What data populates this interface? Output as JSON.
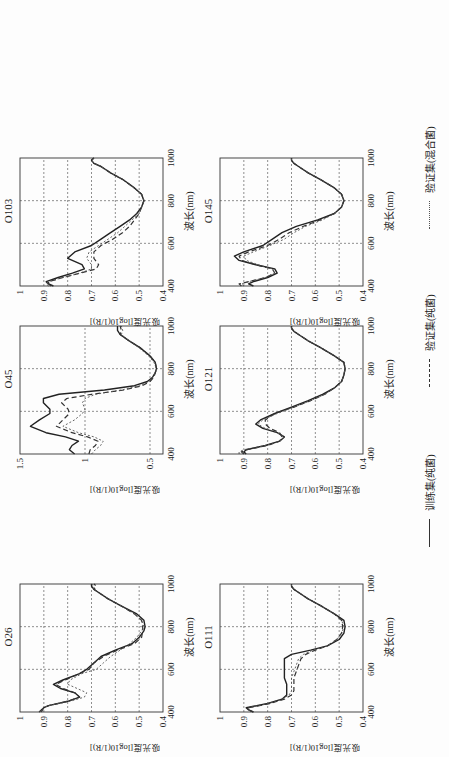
{
  "figure": {
    "orientation_note_rotated_ccw_90": true,
    "xlabel": "波长(nm)",
    "ylabel": "吸光度[log10(1/R)]",
    "legend": [
      {
        "label": "训练集(纯菌)",
        "style": "solid"
      },
      {
        "label": "验证集(纯菌)",
        "style": "dashed"
      },
      {
        "label": "验证集(混合菌)",
        "style": "dotted"
      }
    ]
  },
  "chart_data": [
    {
      "type": "line",
      "title": "O26",
      "xlabel": "波长(nm)",
      "ylabel": "吸光度[log10(1/R)]",
      "xlim": [
        400,
        1000
      ],
      "ylim": [
        0.4,
        1.0
      ],
      "xticks": [
        400,
        600,
        800,
        1000
      ],
      "yticks": [
        0.4,
        0.5,
        0.6,
        0.7,
        0.8,
        0.9,
        1
      ],
      "ytick_labels": [
        "0.4",
        "0.5",
        "0.6",
        "0.7",
        "0.8",
        "0.9",
        "1"
      ],
      "grid": true,
      "x": [
        400,
        420,
        430,
        450,
        470,
        490,
        510,
        530,
        550,
        580,
        600,
        630,
        660,
        690,
        720,
        750,
        780,
        800,
        830,
        860,
        900,
        930,
        960,
        975,
        990,
        1000
      ],
      "series": [
        {
          "name": "训练集(纯菌)",
          "values": [
            0.92,
            0.9,
            0.88,
            0.8,
            0.75,
            0.77,
            0.83,
            0.86,
            0.82,
            0.75,
            0.72,
            0.69,
            0.66,
            0.6,
            0.53,
            0.5,
            0.48,
            0.475,
            0.48,
            0.51,
            0.58,
            0.63,
            0.67,
            0.69,
            0.7,
            0.7
          ]
        },
        {
          "name": "验证集(纯菌)",
          "values": [
            0.91,
            0.9,
            0.88,
            0.8,
            0.75,
            0.77,
            0.82,
            0.85,
            0.81,
            0.75,
            0.71,
            0.69,
            0.65,
            0.59,
            0.52,
            0.49,
            0.485,
            0.485,
            0.49,
            0.52,
            0.58,
            0.63,
            0.67,
            0.69,
            0.68,
            0.69
          ]
        },
        {
          "name": "验证集(混合菌)",
          "values": [
            0.92,
            0.9,
            0.88,
            0.79,
            0.73,
            0.72,
            0.76,
            0.8,
            0.79,
            0.74,
            0.68,
            0.65,
            0.62,
            0.58,
            0.54,
            0.51,
            0.49,
            0.48,
            0.49,
            0.52,
            0.58,
            0.63,
            0.67,
            0.69,
            0.69,
            0.7
          ]
        }
      ]
    },
    {
      "type": "line",
      "title": "O45",
      "xlabel": "波长(nm)",
      "ylabel": "吸光度[log10(1/R)]",
      "xlim": [
        400,
        1000
      ],
      "ylim": [
        0.4,
        1.5
      ],
      "xticks": [
        400,
        600,
        800,
        1000
      ],
      "yticks": [
        0.5,
        1.0,
        1.5
      ],
      "ytick_labels": [
        "0.5",
        "1",
        "1.5"
      ],
      "grid": true,
      "x": [
        400,
        420,
        440,
        460,
        480,
        500,
        530,
        560,
        590,
        610,
        640,
        660,
        680,
        700,
        720,
        740,
        760,
        780,
        800,
        830,
        860,
        900,
        930,
        960,
        980,
        1000
      ],
      "series": [
        {
          "name": "训练集(纯菌)",
          "values": [
            1.08,
            1.12,
            1.1,
            1.05,
            1.15,
            1.3,
            1.42,
            1.35,
            1.27,
            1.27,
            1.32,
            1.32,
            1.2,
            0.85,
            0.62,
            0.52,
            0.48,
            0.46,
            0.45,
            0.46,
            0.5,
            0.58,
            0.66,
            0.73,
            0.75,
            0.75
          ]
        },
        {
          "name": "验证集(纯菌)",
          "values": [
            0.97,
            0.96,
            0.92,
            0.9,
            0.98,
            1.1,
            1.22,
            1.17,
            1.12,
            1.13,
            1.18,
            1.14,
            0.95,
            0.7,
            0.56,
            0.5,
            0.47,
            0.46,
            0.45,
            0.46,
            0.5,
            0.58,
            0.66,
            0.73,
            0.72,
            0.73
          ]
        },
        {
          "name": "验证集(混合菌)",
          "values": [
            0.95,
            0.92,
            0.88,
            0.86,
            0.93,
            1.05,
            1.17,
            1.08,
            1.02,
            1.0,
            1.02,
            1.0,
            0.92,
            0.72,
            0.58,
            0.51,
            0.48,
            0.46,
            0.45,
            0.47,
            0.51,
            0.59,
            0.66,
            0.72,
            0.71,
            0.72
          ]
        }
      ]
    },
    {
      "type": "line",
      "title": "O103",
      "xlabel": "波长(nm)",
      "ylabel": "吸光度[log10(1/R)]",
      "xlim": [
        400,
        1000
      ],
      "ylim": [
        0.4,
        1.0
      ],
      "xticks": [
        400,
        600,
        800,
        1000
      ],
      "yticks": [
        0.4,
        0.5,
        0.6,
        0.7,
        0.8,
        0.9,
        1
      ],
      "ytick_labels": [
        "0.4",
        "0.5",
        "0.6",
        "0.7",
        "0.8",
        "0.9",
        "1"
      ],
      "grid": true,
      "x": [
        400,
        410,
        420,
        440,
        460,
        480,
        500,
        530,
        560,
        590,
        620,
        650,
        680,
        710,
        740,
        770,
        800,
        830,
        860,
        900,
        930,
        960,
        975,
        990,
        1000
      ],
      "series": [
        {
          "name": "训练集(纯菌)",
          "values": [
            0.86,
            0.88,
            0.89,
            0.84,
            0.78,
            0.73,
            0.74,
            0.8,
            0.77,
            0.7,
            0.66,
            0.62,
            0.58,
            0.54,
            0.51,
            0.49,
            0.48,
            0.49,
            0.52,
            0.57,
            0.62,
            0.66,
            0.69,
            0.7,
            0.69
          ]
        },
        {
          "name": "验证集(纯菌)",
          "values": [
            0.87,
            0.88,
            0.88,
            0.82,
            0.75,
            0.68,
            0.67,
            0.69,
            0.69,
            0.66,
            0.61,
            0.57,
            0.54,
            0.52,
            0.5,
            0.49,
            0.48,
            0.49,
            0.52,
            0.57,
            0.62,
            0.66,
            0.69,
            0.7,
            0.69
          ]
        },
        {
          "name": "验证集(混合菌)",
          "values": [
            0.88,
            0.89,
            0.88,
            0.82,
            0.75,
            0.7,
            0.7,
            0.72,
            0.71,
            0.67,
            0.63,
            0.59,
            0.56,
            0.53,
            0.5,
            0.49,
            0.48,
            0.49,
            0.52,
            0.57,
            0.62,
            0.66,
            0.69,
            0.7,
            0.69
          ]
        }
      ]
    },
    {
      "type": "line",
      "title": "O111",
      "xlabel": "波长(nm)",
      "ylabel": "吸光度[log10(1/R)]",
      "xlim": [
        400,
        1000
      ],
      "ylim": [
        0.4,
        1.0
      ],
      "xticks": [
        400,
        600,
        800,
        1000
      ],
      "yticks": [
        0.4,
        0.5,
        0.6,
        0.7,
        0.8,
        0.9,
        1
      ],
      "ytick_labels": [
        "0.4",
        "0.5",
        "0.6",
        "0.7",
        "0.8",
        "0.9",
        "1"
      ],
      "grid": true,
      "x": [
        400,
        410,
        420,
        440,
        460,
        480,
        500,
        530,
        560,
        590,
        620,
        650,
        670,
        690,
        710,
        740,
        770,
        800,
        830,
        860,
        900,
        930,
        960,
        975,
        990,
        1000
      ],
      "series": [
        {
          "name": "训练集(纯菌)",
          "values": [
            0.86,
            0.88,
            0.89,
            0.8,
            0.74,
            0.72,
            0.72,
            0.72,
            0.73,
            0.73,
            0.73,
            0.73,
            0.7,
            0.62,
            0.55,
            0.5,
            0.48,
            0.475,
            0.48,
            0.52,
            0.58,
            0.63,
            0.67,
            0.69,
            0.7,
            0.7
          ]
        },
        {
          "name": "验证集(纯菌)",
          "values": [
            0.86,
            0.88,
            0.88,
            0.79,
            0.73,
            0.7,
            0.69,
            0.69,
            0.69,
            0.68,
            0.67,
            0.66,
            0.64,
            0.6,
            0.55,
            0.51,
            0.49,
            0.485,
            0.49,
            0.52,
            0.58,
            0.63,
            0.67,
            0.69,
            0.7,
            0.7
          ]
        },
        {
          "name": "验证集(混合菌)",
          "values": [
            0.87,
            0.88,
            0.88,
            0.8,
            0.74,
            0.71,
            0.7,
            0.7,
            0.7,
            0.69,
            0.68,
            0.67,
            0.65,
            0.61,
            0.55,
            0.51,
            0.49,
            0.48,
            0.49,
            0.52,
            0.58,
            0.63,
            0.67,
            0.69,
            0.7,
            0.7
          ]
        }
      ]
    },
    {
      "type": "line",
      "title": "O121",
      "xlabel": "波长(nm)",
      "ylabel": "吸光度[log10(1/R)]",
      "xlim": [
        400,
        1000
      ],
      "ylim": [
        0.4,
        1.0
      ],
      "xticks": [
        400,
        600,
        800,
        1000
      ],
      "yticks": [
        0.4,
        0.5,
        0.6,
        0.7,
        0.8,
        0.9,
        1
      ],
      "ytick_labels": [
        "0.4",
        "0.5",
        "0.6",
        "0.7",
        "0.8",
        "0.9",
        "1"
      ],
      "grid": true,
      "x": [
        400,
        410,
        420,
        440,
        460,
        480,
        500,
        520,
        540,
        560,
        590,
        620,
        650,
        680,
        710,
        740,
        770,
        800,
        830,
        860,
        900,
        930,
        960,
        975,
        990,
        1000
      ],
      "series": [
        {
          "name": "训练集(纯菌)",
          "values": [
            0.89,
            0.9,
            0.89,
            0.81,
            0.75,
            0.73,
            0.76,
            0.82,
            0.85,
            0.83,
            0.77,
            0.7,
            0.63,
            0.57,
            0.52,
            0.49,
            0.48,
            0.475,
            0.48,
            0.52,
            0.58,
            0.63,
            0.67,
            0.69,
            0.7,
            0.7
          ]
        },
        {
          "name": "验证集(纯菌)",
          "values": [
            0.9,
            0.91,
            0.89,
            0.8,
            0.75,
            0.74,
            0.75,
            0.79,
            0.81,
            0.81,
            0.77,
            0.69,
            0.62,
            0.56,
            0.52,
            0.49,
            0.48,
            0.475,
            0.48,
            0.52,
            0.58,
            0.63,
            0.67,
            0.69,
            0.7,
            0.7
          ]
        },
        {
          "name": "验证集(混合菌)",
          "values": [
            0.92,
            0.92,
            0.9,
            0.81,
            0.75,
            0.73,
            0.76,
            0.81,
            0.84,
            0.82,
            0.76,
            0.69,
            0.62,
            0.56,
            0.52,
            0.49,
            0.48,
            0.475,
            0.48,
            0.52,
            0.58,
            0.63,
            0.67,
            0.69,
            0.7,
            0.7
          ]
        }
      ]
    },
    {
      "type": "line",
      "title": "O145",
      "xlabel": "波长(nm)",
      "ylabel": "吸光度[log10(1/R)]",
      "xlim": [
        400,
        1000
      ],
      "ylim": [
        0.4,
        1.0
      ],
      "xticks": [
        400,
        600,
        800,
        1000
      ],
      "yticks": [
        0.4,
        0.5,
        0.6,
        0.7,
        0.8,
        0.9,
        1
      ],
      "ytick_labels": [
        "0.4",
        "0.5",
        "0.6",
        "0.7",
        "0.8",
        "0.9",
        "1"
      ],
      "grid": true,
      "x": [
        400,
        410,
        420,
        440,
        460,
        480,
        500,
        520,
        540,
        560,
        590,
        620,
        650,
        680,
        710,
        740,
        770,
        800,
        830,
        860,
        900,
        930,
        960,
        975,
        990,
        1000
      ],
      "series": [
        {
          "name": "训练集(纯菌)",
          "values": [
            0.86,
            0.88,
            0.86,
            0.8,
            0.76,
            0.77,
            0.85,
            0.92,
            0.94,
            0.9,
            0.82,
            0.78,
            0.74,
            0.68,
            0.59,
            0.52,
            0.49,
            0.48,
            0.49,
            0.52,
            0.58,
            0.63,
            0.67,
            0.69,
            0.7,
            0.7
          ]
        },
        {
          "name": "验证集(纯菌)",
          "values": [
            0.91,
            0.92,
            0.88,
            0.81,
            0.77,
            0.78,
            0.85,
            0.91,
            0.92,
            0.88,
            0.8,
            0.75,
            0.71,
            0.65,
            0.58,
            0.52,
            0.49,
            0.48,
            0.49,
            0.52,
            0.58,
            0.63,
            0.67,
            0.69,
            0.7,
            0.7
          ]
        },
        {
          "name": "验证集(混合菌)",
          "values": [
            0.9,
            0.91,
            0.88,
            0.81,
            0.77,
            0.78,
            0.84,
            0.89,
            0.9,
            0.86,
            0.79,
            0.73,
            0.69,
            0.64,
            0.57,
            0.52,
            0.49,
            0.48,
            0.49,
            0.52,
            0.58,
            0.63,
            0.67,
            0.69,
            0.7,
            0.7
          ]
        }
      ]
    }
  ]
}
